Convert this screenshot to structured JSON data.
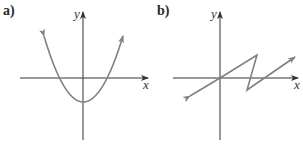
{
  "panels": [
    {
      "label": "a)",
      "x_axis_label": "x",
      "y_axis_label": "y",
      "curve": "parabola",
      "description": "Upward-opening parabola with vertex below origin, crossing x-axis on both sides, arrows at both ends"
    },
    {
      "label": "b)",
      "x_axis_label": "x",
      "y_axis_label": "y",
      "curve": "zigzag",
      "description": "Piecewise-linear Z-shaped graph: line through origin rising to a peak, dropping to a trough below x-axis, then rising again; arrows at both ends"
    }
  ],
  "colors": {
    "axis": "#333333",
    "curve": "#808080",
    "background": "#ffffff"
  }
}
